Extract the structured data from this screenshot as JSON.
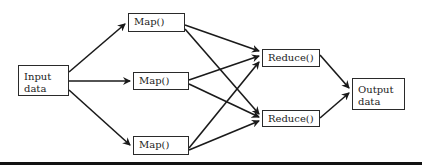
{
  "diagram": {
    "type": "mapreduce-flow",
    "colors": {
      "stroke": "#1a1a1a",
      "box_border": "#2a2a2a",
      "text": "#222222",
      "background": "#ffffff"
    },
    "nodes": {
      "input": {
        "label_line1": "Input",
        "label_line2": "data"
      },
      "map1": {
        "label": "Map()"
      },
      "map2": {
        "label": "Map()"
      },
      "map3": {
        "label": "Map()"
      },
      "reduce1": {
        "label": "Reduce()"
      },
      "reduce2": {
        "label": "Reduce()"
      },
      "output": {
        "label_line1": "Output",
        "label_line2": "data"
      }
    },
    "edges": [
      [
        "input",
        "map1"
      ],
      [
        "input",
        "map2"
      ],
      [
        "input",
        "map3"
      ],
      [
        "map1",
        "reduce1"
      ],
      [
        "map1",
        "reduce2"
      ],
      [
        "map2",
        "reduce1"
      ],
      [
        "map2",
        "reduce2"
      ],
      [
        "map3",
        "reduce1"
      ],
      [
        "map3",
        "reduce2"
      ],
      [
        "reduce1",
        "output"
      ],
      [
        "reduce2",
        "output"
      ]
    ]
  }
}
